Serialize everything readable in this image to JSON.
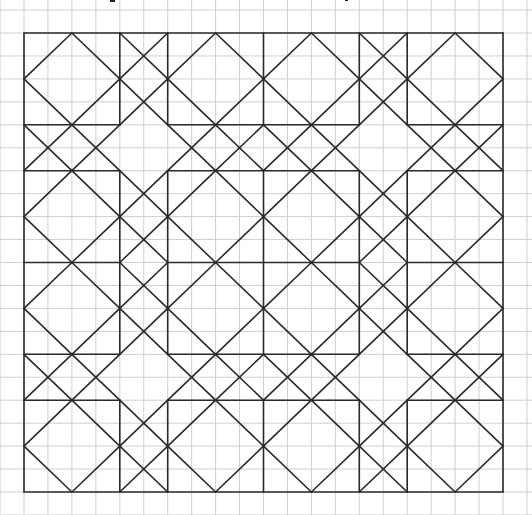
{
  "figure": {
    "title_fragment_marks": [
      {
        "x": 110,
        "y": 0,
        "w": 5,
        "h": 2
      },
      {
        "x": 345,
        "y": 0,
        "w": 3,
        "h": 1
      }
    ],
    "background_grid": {
      "color": "#cfcfcf",
      "x_origin": 24,
      "x_step": 23.95,
      "y_origin": 33,
      "y_step": 22.95
    },
    "pattern": {
      "units": 20,
      "stroke_color": "#2a2a2a",
      "origin_px": [
        24,
        33
      ],
      "size_px": [
        479,
        459
      ],
      "band_breaks": [
        0,
        4,
        6,
        10,
        14,
        16,
        20
      ],
      "orthogonal_lines": {
        "positions": [
          0,
          4,
          6,
          10,
          14,
          16,
          20
        ],
        "outer": [
          0,
          20
        ],
        "inner_segments": [
          [
            0,
            4
          ],
          [
            6,
            14
          ],
          [
            16,
            20
          ]
        ]
      },
      "diamond_squares": [
        [
          0,
          0
        ],
        [
          6,
          0
        ],
        [
          10,
          0
        ],
        [
          16,
          0
        ],
        [
          0,
          6
        ],
        [
          6,
          6
        ],
        [
          10,
          6
        ],
        [
          16,
          6
        ],
        [
          0,
          10
        ],
        [
          6,
          10
        ],
        [
          10,
          10
        ],
        [
          16,
          10
        ],
        [
          0,
          16
        ],
        [
          6,
          16
        ],
        [
          10,
          16
        ],
        [
          16,
          16
        ]
      ],
      "x_strips": [
        [
          4,
          0,
          2,
          4
        ],
        [
          14,
          0,
          2,
          4
        ],
        [
          4,
          6,
          2,
          8
        ],
        [
          14,
          6,
          2,
          8
        ],
        [
          4,
          16,
          2,
          4
        ],
        [
          14,
          16,
          2,
          4
        ],
        [
          0,
          4,
          4,
          2
        ],
        [
          16,
          4,
          4,
          2
        ],
        [
          6,
          4,
          8,
          2
        ],
        [
          6,
          14,
          8,
          2
        ],
        [
          0,
          14,
          4,
          2
        ],
        [
          16,
          14,
          4,
          2
        ]
      ],
      "empty_junctions": [
        [
          4,
          4
        ],
        [
          14,
          4
        ],
        [
          4,
          14
        ],
        [
          14,
          14
        ]
      ]
    }
  }
}
